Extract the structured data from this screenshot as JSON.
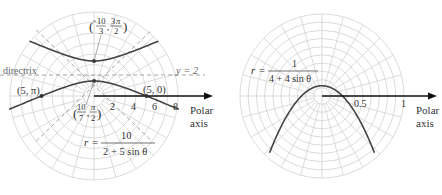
{
  "chart_data": [
    {
      "type": "line",
      "title": "",
      "subtitle": "Hyperbola in polar coordinates",
      "equation": {
        "lhs": "r =",
        "num": "10",
        "den": "2 + 5 sin θ"
      },
      "polar": true,
      "grid": true,
      "rings": 8,
      "ring_step": 1,
      "spokes_deg": 15,
      "axis_label": [
        "Polar",
        "axis"
      ],
      "tick_labels": [
        "2",
        "4",
        "6",
        "8"
      ],
      "tick_values": [
        2,
        4,
        6,
        8
      ],
      "directrix": {
        "label": "directrix",
        "eq_label": "y = 2",
        "y": 2
      },
      "points": [
        {
          "label": "(5, π)",
          "r": 5,
          "theta_deg": 180
        },
        {
          "label": "(5, 0)",
          "r": 5,
          "theta_deg": 0
        },
        {
          "label_num": "10",
          "label_den": "7",
          "label_angle": "π/2",
          "r": 1.4286,
          "theta_deg": 90,
          "display": "(10/7, π/2)"
        },
        {
          "label_num": "10",
          "label_den": "3",
          "label_angle": "3π/2",
          "r": -3.3333,
          "theta_deg": 270,
          "display": "(−10/3, 3π/2)"
        }
      ],
      "series": [
        {
          "name": "r = 10/(2 + 5 sin θ)",
          "ed": 10,
          "a": 2,
          "b": 5
        }
      ]
    },
    {
      "type": "line",
      "title": "",
      "subtitle": "Parabola in polar coordinates",
      "equation": {
        "lhs": "r =",
        "num": "1",
        "den": "4 + 4 sin θ"
      },
      "polar": true,
      "grid": true,
      "rings": 10,
      "ring_step": 0.1,
      "spokes_deg": 15,
      "axis_label": [
        "Polar",
        "axis"
      ],
      "tick_labels": [
        "0.5",
        "1"
      ],
      "tick_values": [
        0.5,
        1
      ],
      "series": [
        {
          "name": "r = 1/(4 + 4 sin θ)",
          "ed": 1,
          "a": 4,
          "b": 4
        }
      ]
    }
  ]
}
